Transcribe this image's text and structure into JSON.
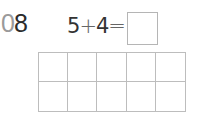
{
  "problem": {
    "number_prefix": "0",
    "number_main": "8",
    "operand_a": "5",
    "operator": "+",
    "operand_b": "4",
    "equals": "=",
    "answer": ""
  },
  "ten_frame": {
    "rows": 2,
    "columns": 5,
    "filled_cells": 0
  },
  "colors": {
    "prefix_gray": "#9a9a9a",
    "text_dark": "#2b2b2b",
    "grid_line": "#bdbdbd"
  }
}
